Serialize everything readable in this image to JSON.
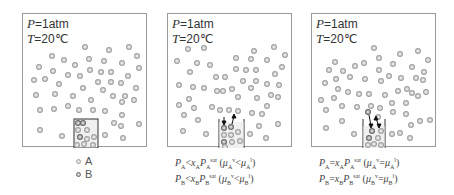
{
  "colors": {
    "frame": "#9a9a9a",
    "particle_A_fill": "#e6e6e6",
    "particle_A_ring": "#a0a0a0",
    "particle_B_fill": "#d0d0d0",
    "particle_B_ring": "#6a6a6a",
    "container": "#333333",
    "liquid_bg": "#f0f0f0"
  },
  "conditions": {
    "pressure_symbol": "P",
    "pressure_value": "=1atm",
    "temperature_symbol": "T",
    "temperature_value": "=20℃"
  },
  "legend": {
    "a_label": "A",
    "b_label": "B"
  },
  "panels": [
    {
      "id": "initial",
      "eq1": "",
      "eq2": ""
    },
    {
      "id": "nonequilibrium",
      "eq1": {
        "lhs": "P",
        "lsub": "A",
        "rel": "<",
        "x": "x",
        "xsub": "A",
        "p": "P",
        "psub": "A",
        "psup": "sat",
        "mu_rel": "<",
        "mu_l_sub": "A",
        "mu_l_sup": "v",
        "mu_r_sub": "A",
        "mu_r_sup": "l"
      },
      "eq2": {
        "lhs": "P",
        "lsub": "B",
        "rel": "<",
        "x": "x",
        "xsub": "B",
        "p": "P",
        "psub": "B",
        "psup": "sat",
        "mu_rel": "<",
        "mu_l_sub": "B",
        "mu_l_sup": "v",
        "mu_r_sub": "B",
        "mu_r_sup": "l"
      }
    },
    {
      "id": "equilibrium",
      "eq1": {
        "lhs": "P",
        "lsub": "A",
        "rel": "=",
        "x": "x",
        "xsub": "A",
        "p": "P",
        "psub": "A",
        "psup": "sat",
        "mu_rel": "=",
        "mu_l_sub": "A",
        "mu_l_sup": "v",
        "mu_r_sub": "A",
        "mu_r_sup": "l"
      },
      "eq2": {
        "lhs": "P",
        "lsub": "B",
        "rel": "=",
        "x": "x",
        "xsub": "B",
        "p": "P",
        "psub": "B",
        "psup": "sat",
        "mu_rel": "=",
        "mu_l_sub": "B",
        "mu_l_sup": "v",
        "mu_r_sub": "B",
        "mu_r_sup": "l"
      }
    }
  ]
}
